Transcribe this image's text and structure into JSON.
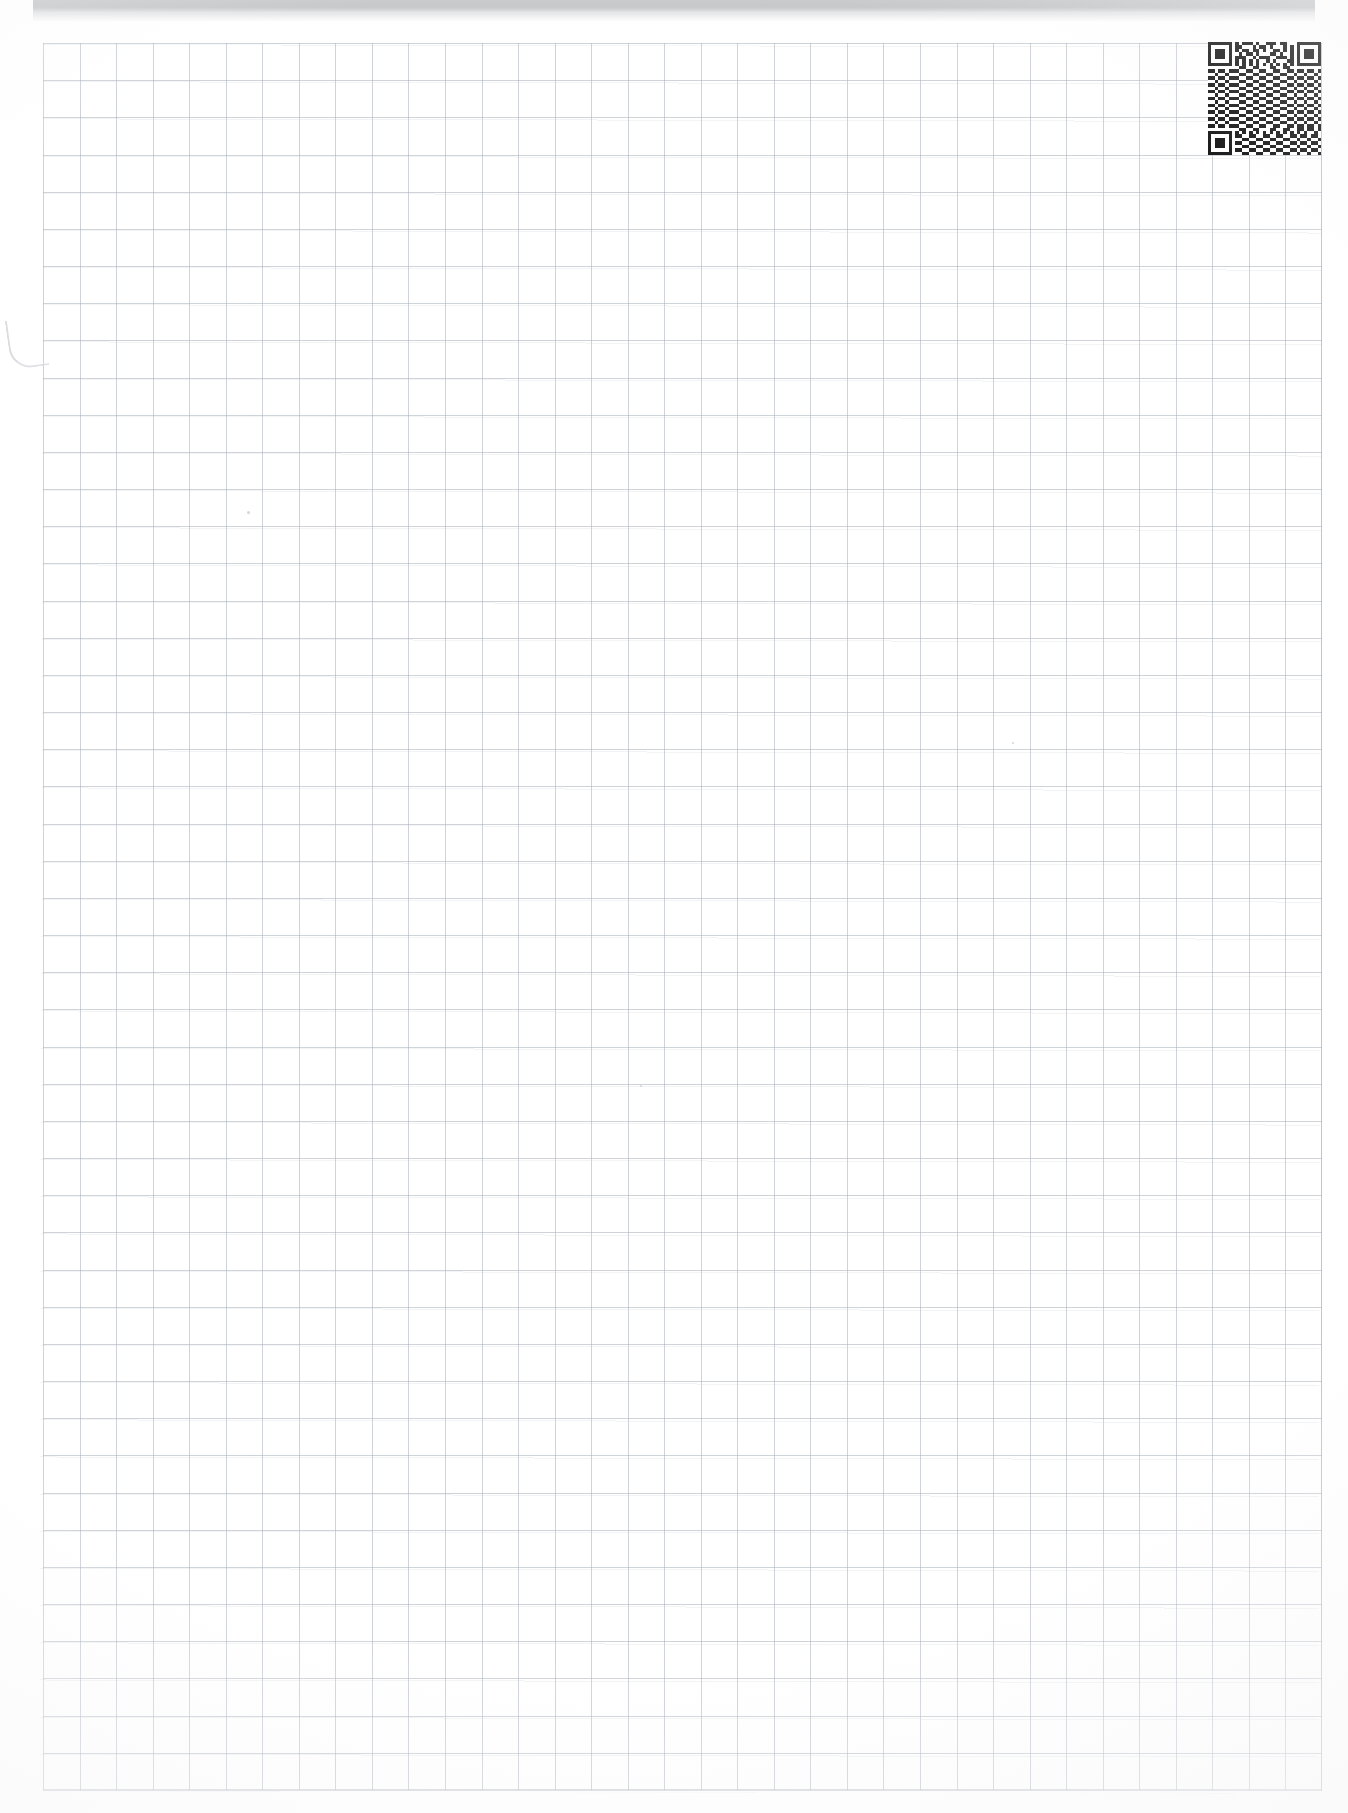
{
  "document": {
    "type": "scanned-graph-paper-sheet",
    "page_title": "",
    "visible_text": "",
    "background_color": "#ffffff",
    "grid_line_color": "#a8b0ba",
    "grid_columns": 35,
    "grid_rows": 47,
    "grid_cell_px": 37
  },
  "scanner_band": {
    "label": "",
    "color": "#c7c9cb",
    "faint_text": ""
  },
  "qr_code": {
    "name": "qr-code",
    "alt_label": "",
    "modules": 33,
    "foreground": "#111111",
    "background": "#ffffff",
    "matrix": [
      "111111101011101001110110001111111",
      "100000101100010110100010101000001",
      "101110101011011010011010101011101",
      "101110100101101000110100101011101",
      "101110101110010111001110101011101",
      "100000101010101001010001101000001",
      "111111101010101010101010101111111",
      "000000000110011000110011000000000",
      "110110111001100110011001101101101",
      "001001000110011001100110010010010",
      "110110111001100110011001101101101",
      "001001000110011001100110010010010",
      "110110111001100110011001101101101",
      "001001000110011001100110010010010",
      "110110111001100110011001101101101",
      "001001000110011001100110010010010",
      "110110111001100110011001101101101",
      "001001000110011001100110010010010",
      "110110111001100110011001101101101",
      "001001000110011001100110010010010",
      "110110111001100110011001101101101",
      "001001000110011001100110010010010",
      "110110111001100110011001101101101",
      "001001000110011001100110010010010",
      "110110111001100110011001101101101",
      "000000000110011000110011001101101",
      "111111101010101010101010101010010",
      "100000101100110011001100110110110",
      "101110100011001100110011001001001",
      "101110101100110011001100110110110",
      "101110100011001100110011001001001",
      "100000101100110011001100110110110",
      "111111100011001100110011001001001"
    ]
  },
  "artifacts": {
    "left_margin_smudge": "pen-stroke-smudge",
    "specks": 3
  }
}
